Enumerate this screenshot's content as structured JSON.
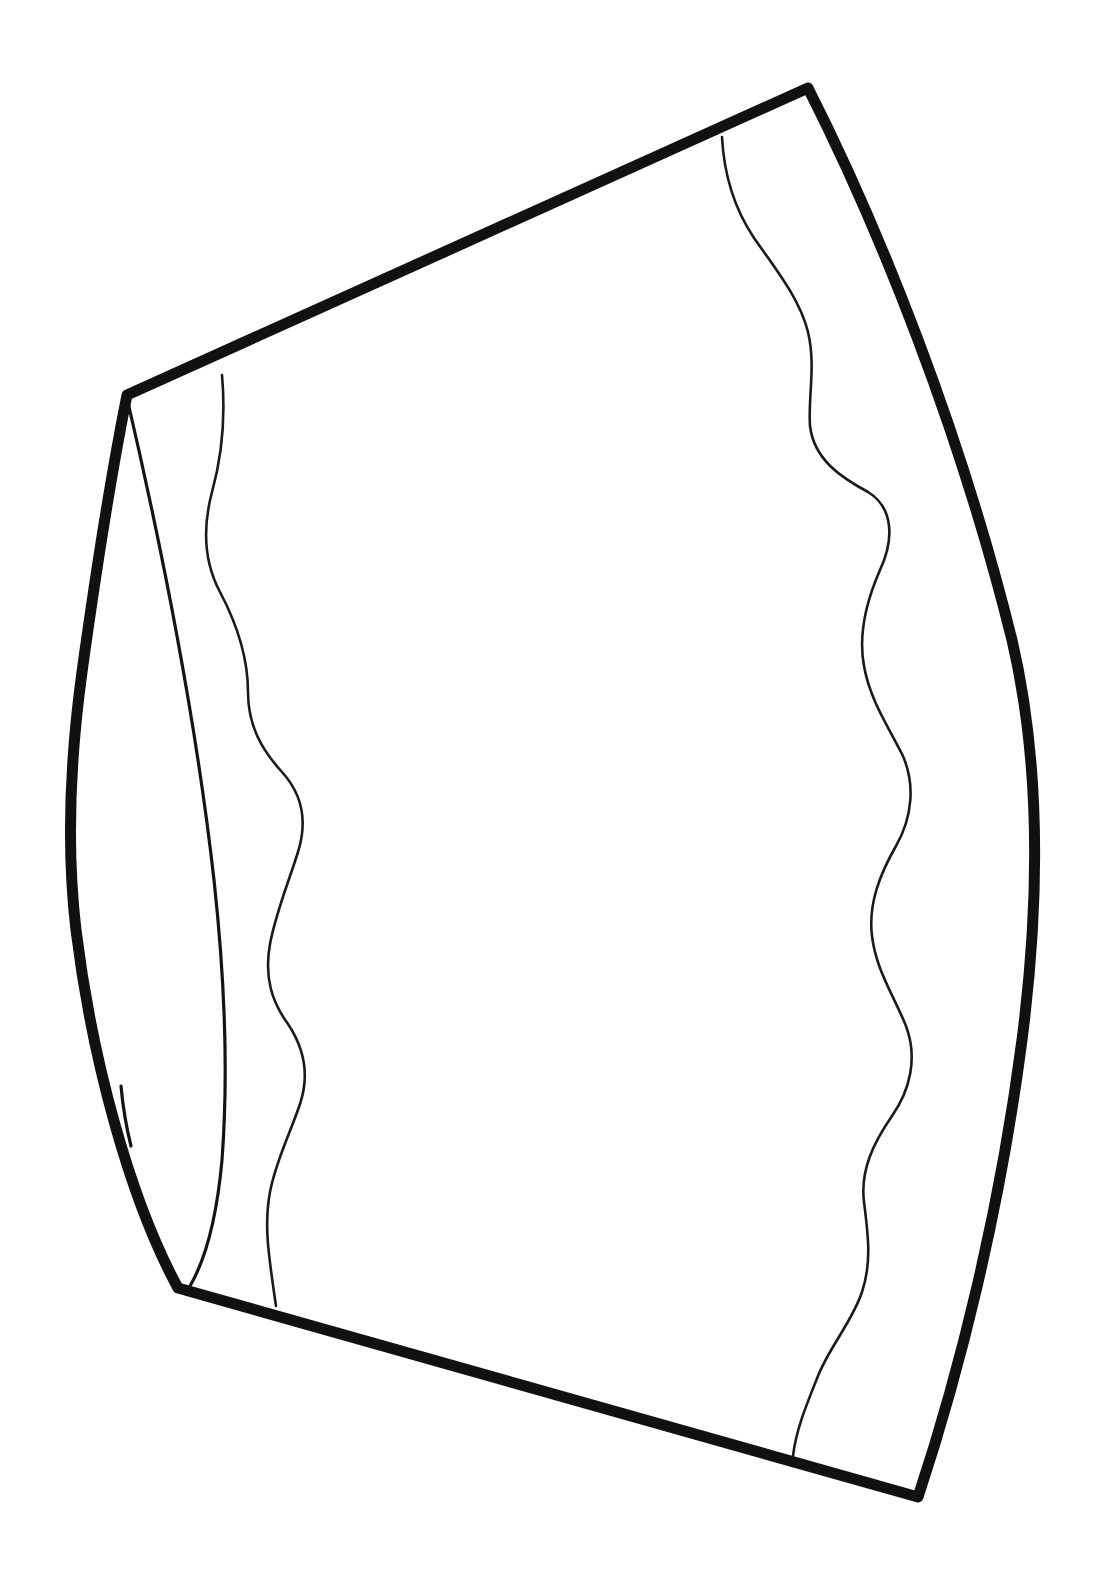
{
  "page": {
    "title": "Hand-drawn line illustration",
    "width": 1100,
    "height": 1588,
    "background_color": "#ffffff",
    "ink_color": "#111111",
    "description": "Black ink outline drawing of a tapered drum / truncated-cone vessel seen in three-quarter perspective, with two thin wavy vertical lines across its body and a thin inner arc at the left showing the far side of the rim."
  },
  "figure": {
    "name": "tapered-drum-outline",
    "style": "hand-drawn ink contour, no shading, no fill",
    "line_weights": {
      "outline_px": 11,
      "detail_px": 3,
      "wavy_px": 3
    },
    "vertices": {
      "top_left": [
        127,
        395
      ],
      "top_right": [
        808,
        88
      ],
      "bottom_right": [
        918,
        1497
      ],
      "bottom_left": [
        178,
        1288
      ]
    },
    "extremes": {
      "left_bulge_x": 70,
      "left_bulge_y": 830,
      "right_bulge_x": 1040,
      "right_bulge_y": 820
    },
    "outline_path": "M 127 395 L 808 88 C 880 230 960 430 1012 640 C 1040 760 1040 900 1022 1040 C 1000 1210 960 1370 918 1497 L 178 1288 C 130 1200 92 1060 76 930 C 66 845 70 760 82 672 C 95 578 110 480 127 395 Z",
    "inner_rim_arc": {
      "name": "back-rim-arc",
      "from": [
        127,
        398
      ],
      "to": [
        190,
        1286
      ],
      "path": "M 127 398 C 160 540 196 720 214 880 C 226 990 228 1080 222 1160 C 216 1226 204 1262 190 1286"
    },
    "wavy_lines": [
      {
        "name": "left-wavy-line",
        "start": [
          222,
          375
        ],
        "end": [
          276,
          1306
        ],
        "wave_count": 9,
        "path": "M 222 375 C 226 420 222 456 212 492 C 202 530 204 562 220 592 C 238 626 248 658 248 692 C 248 726 262 750 282 772 C 302 794 308 820 298 852 C 288 884 276 912 270 944 C 264 978 272 1002 288 1024 C 304 1048 310 1074 300 1104 C 290 1134 276 1160 270 1192 C 264 1224 268 1252 276 1306"
      },
      {
        "name": "right-wavy-line",
        "start": [
          722,
          137
        ],
        "end": [
          793,
          1456
        ],
        "wave_count": 10,
        "path": "M 722 137 C 724 176 734 208 754 238 C 778 272 800 300 808 332 C 816 366 808 396 810 426 C 814 460 842 478 868 492 C 894 508 894 540 880 570 C 866 602 858 634 864 666 C 870 700 888 726 902 754 C 916 784 912 818 896 846 C 880 874 868 904 872 936 C 876 970 894 996 906 1026 C 918 1058 910 1090 892 1116 C 874 1142 860 1170 864 1202 C 868 1234 872 1262 862 1292 C 852 1322 830 1346 818 1376 C 806 1406 796 1430 793 1456"
      }
    ],
    "extra_marks": [
      {
        "name": "left-edge-double-stroke",
        "path": "M 121 1086 C 123 1108 126 1126 131 1146"
      }
    ]
  }
}
